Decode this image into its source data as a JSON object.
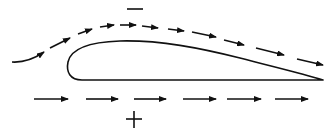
{
  "diagram": {
    "labels": {
      "upper_pressure": "−",
      "lower_pressure": "+"
    },
    "colors": {
      "stroke": "#111111",
      "background": "#ffffff"
    },
    "airfoil": {
      "leading_edge_x": 68,
      "trailing_edge": [
        323,
        80
      ],
      "top_y": 42,
      "bottom_y": 80
    },
    "upper_flow_arrows": [
      {
        "x1": 12,
        "y1": 62,
        "x2": 44,
        "y2": 52,
        "curved": true
      },
      {
        "x1": 50,
        "y1": 48,
        "x2": 70,
        "y2": 38
      },
      {
        "x1": 78,
        "y1": 34,
        "x2": 92,
        "y2": 29
      },
      {
        "x1": 100,
        "y1": 27,
        "x2": 114,
        "y2": 25
      },
      {
        "x1": 120,
        "y1": 25,
        "x2": 136,
        "y2": 25
      },
      {
        "x1": 142,
        "y1": 26,
        "x2": 158,
        "y2": 28
      },
      {
        "x1": 168,
        "y1": 29,
        "x2": 184,
        "y2": 31
      },
      {
        "x1": 192,
        "y1": 32,
        "x2": 216,
        "y2": 37
      },
      {
        "x1": 224,
        "y1": 40,
        "x2": 244,
        "y2": 45
      },
      {
        "x1": 256,
        "y1": 48,
        "x2": 284,
        "y2": 55
      },
      {
        "x1": 297,
        "y1": 59,
        "x2": 323,
        "y2": 65
      }
    ],
    "lower_flow_arrows": [
      {
        "x1": 34,
        "y1": 99,
        "x2": 68,
        "y2": 99
      },
      {
        "x1": 86,
        "y1": 99,
        "x2": 118,
        "y2": 99
      },
      {
        "x1": 134,
        "y1": 99,
        "x2": 166,
        "y2": 99
      },
      {
        "x1": 183,
        "y1": 99,
        "x2": 216,
        "y2": 99
      },
      {
        "x1": 227,
        "y1": 99,
        "x2": 261,
        "y2": 99
      },
      {
        "x1": 275,
        "y1": 99,
        "x2": 308,
        "y2": 99
      }
    ]
  }
}
